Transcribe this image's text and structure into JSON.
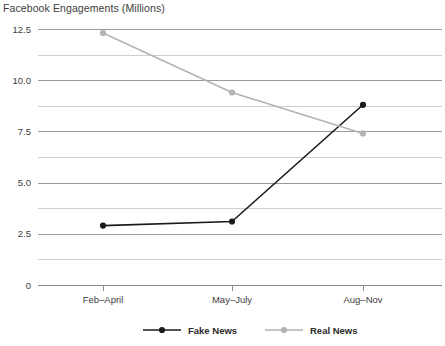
{
  "chart_data": {
    "type": "line",
    "title": "Facebook Engagements (Millions)",
    "xlabel": "",
    "ylabel": "",
    "categories": [
      "Feb–April",
      "May–July",
      "Aug–Nov"
    ],
    "series": [
      {
        "name": "Fake News",
        "values": [
          2.9,
          3.1,
          8.8
        ],
        "color": "#1a1a1a"
      },
      {
        "name": "Real News",
        "values": [
          12.3,
          9.4,
          7.4
        ],
        "color": "#b3b3b3"
      }
    ],
    "ylim": [
      0,
      12.5
    ],
    "yticks": [
      0,
      2.5,
      5.0,
      7.5,
      10.0,
      12.5
    ],
    "ytick_labels": [
      "0",
      "2.5",
      "5.0",
      "7.5",
      "10.0",
      "12.5"
    ],
    "yticks_minor": [
      1.25,
      3.75,
      6.25,
      8.75,
      11.25
    ],
    "grid": true,
    "legend_position": "bottom"
  },
  "legend": {
    "items": [
      {
        "label": "Fake News"
      },
      {
        "label": "Real News"
      }
    ]
  },
  "colors": {
    "fake_news": "#1a1a1a",
    "real_news": "#b3b3b3",
    "grid_major": "#9a9a9a",
    "grid_minor": "#cfcfcf",
    "axis": "#8c8c8c",
    "text": "#3d3d3d",
    "background": "#ffffff"
  }
}
